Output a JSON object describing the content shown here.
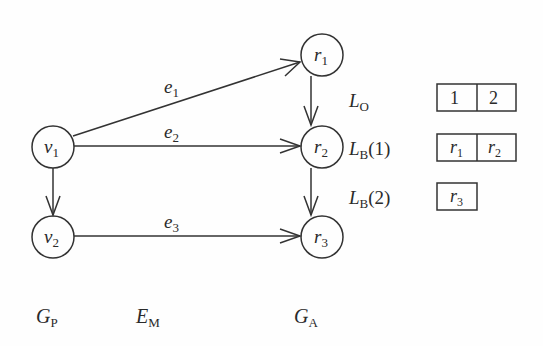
{
  "diagram": {
    "colors": {
      "stroke": "#333333",
      "text": "#2a2a2a",
      "background": "#fefefe"
    },
    "pattern_graph": {
      "label": {
        "main": "G",
        "sub": "P"
      },
      "nodes": [
        {
          "id": "v1",
          "main": "v",
          "sub": "1",
          "cx": 53,
          "cy": 147
        },
        {
          "id": "v2",
          "main": "v",
          "sub": "2",
          "cx": 53,
          "cy": 237
        }
      ],
      "edges": [
        {
          "from": "v1",
          "to": "v2"
        }
      ]
    },
    "mapping": {
      "label": {
        "main": "E",
        "sub": "M"
      },
      "edges": [
        {
          "id": "e1",
          "main": "e",
          "sub": "1",
          "from": "v1",
          "to": "r1"
        },
        {
          "id": "e2",
          "main": "e",
          "sub": "2",
          "from": "v1",
          "to": "r2"
        },
        {
          "id": "e3",
          "main": "e",
          "sub": "3",
          "from": "v2",
          "to": "r3"
        }
      ]
    },
    "architecture_graph": {
      "label": {
        "main": "G",
        "sub": "A"
      },
      "nodes": [
        {
          "id": "r1",
          "main": "r",
          "sub": "1",
          "cx": 322,
          "cy": 55
        },
        {
          "id": "r2",
          "main": "r",
          "sub": "2",
          "cx": 322,
          "cy": 147
        },
        {
          "id": "r3",
          "main": "r",
          "sub": "3",
          "cx": 322,
          "cy": 237
        }
      ],
      "edges": [
        {
          "from": "r1",
          "to": "r2"
        },
        {
          "from": "r2",
          "to": "r3"
        }
      ]
    },
    "lists": [
      {
        "id": "LO",
        "label": {
          "main": "L",
          "sub": "O",
          "arg": ""
        },
        "cells": [
          {
            "main": "1",
            "sub": ""
          },
          {
            "main": "2",
            "sub": ""
          }
        ]
      },
      {
        "id": "LB1",
        "label": {
          "main": "L",
          "sub": "B",
          "arg": "(1)"
        },
        "cells": [
          {
            "main": "r",
            "sub": "1"
          },
          {
            "main": "r",
            "sub": "2"
          }
        ]
      },
      {
        "id": "LB2",
        "label": {
          "main": "L",
          "sub": "B",
          "arg": "(2)"
        },
        "cells": [
          {
            "main": "r",
            "sub": "3"
          }
        ]
      }
    ]
  }
}
